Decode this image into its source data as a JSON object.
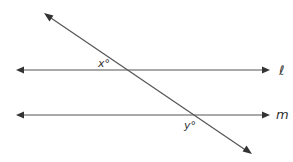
{
  "diagram": {
    "colors": {
      "line": "#555555",
      "arrowhead": "#333333",
      "label": "#333333",
      "background": "#ffffff"
    },
    "lines": [
      {
        "id": "l",
        "label": "ℓ",
        "type": "horizontal",
        "y": 70,
        "x1": 16,
        "x2": 270,
        "label_x": 280,
        "label_y": 75
      },
      {
        "id": "m",
        "label": "m",
        "type": "horizontal",
        "y": 115,
        "x1": 16,
        "x2": 270,
        "label_x": 277,
        "label_y": 119
      }
    ],
    "transversal": {
      "x1": 44,
      "y1": 13,
      "x2": 252,
      "y2": 154
    },
    "angles": [
      {
        "id": "x",
        "label": "x°",
        "x": 98,
        "y": 67
      },
      {
        "id": "y",
        "label": "y°",
        "x": 184,
        "y": 129
      }
    ],
    "relationship": "ℓ ∥ m"
  }
}
